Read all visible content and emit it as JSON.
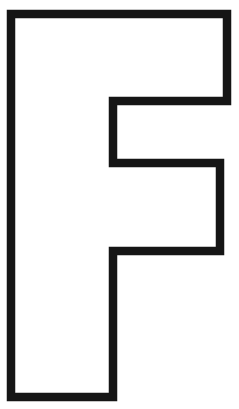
{
  "canvas": {
    "width": 239,
    "height": 409,
    "background_color": "#ffffff"
  },
  "artwork": {
    "kind": "letter-outline",
    "character": "F",
    "description": "Outlined block capital letter F",
    "style": "hollow outline, thick black stroke, white fill",
    "stroke_color": "#151515",
    "fill_color": "#ffffff",
    "stroke_width": 8.5,
    "outline_points": "11,14 227,14 227,101 113,101 113,163 220,163 220,251 113,251 113,397 11,397",
    "bounds": {
      "left": 11,
      "top": 14,
      "right": 227,
      "bottom": 397
    },
    "segments": [
      {
        "name": "top-arm",
        "x": 11,
        "y": 14,
        "width": 216,
        "height": 87
      },
      {
        "name": "middle-arm",
        "x": 113,
        "y": 163,
        "width": 107,
        "height": 88
      },
      {
        "name": "stem",
        "x": 11,
        "y": 14,
        "width": 102,
        "height": 383
      }
    ]
  }
}
